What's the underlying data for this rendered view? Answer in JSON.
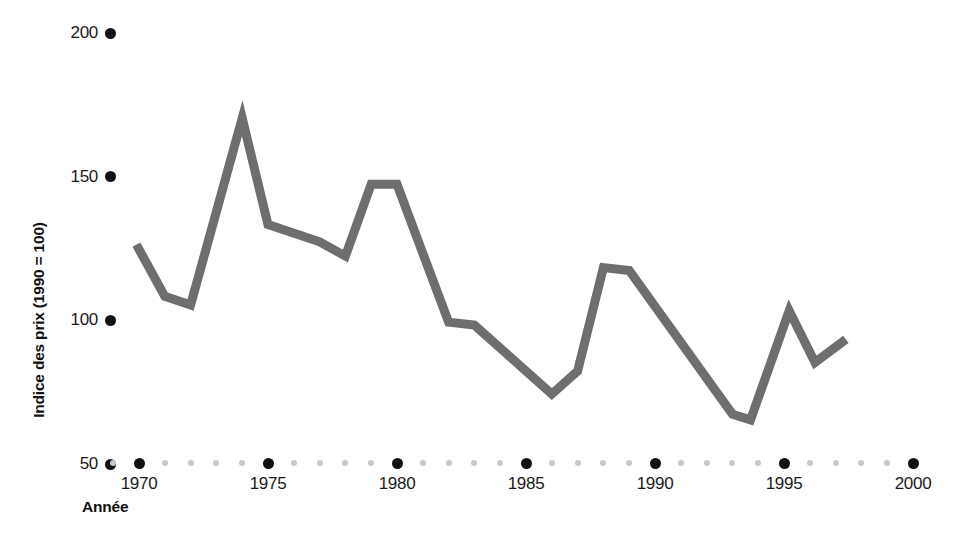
{
  "chart_data": {
    "type": "line",
    "title": "",
    "xlabel": "Année",
    "ylabel": "Indice des prix (1990 = 100)",
    "xlim": [
      1969,
      2000
    ],
    "ylim": [
      50,
      200
    ],
    "yticks": [
      50,
      100,
      150,
      200
    ],
    "xticks": [
      1970,
      1975,
      1980,
      1985,
      1990,
      1995,
      2000
    ],
    "x_minor_step": 1,
    "grid": false,
    "legend": null,
    "line_color": "#6e6e6e",
    "tick_color": "#111111",
    "minor_tick_color": "#c9c9c9",
    "series": [
      {
        "name": "Indice des prix",
        "x": [
          1969.9,
          1971.0,
          1972.0,
          1974.0,
          1975.0,
          1977.0,
          1978.0,
          1979.0,
          1980.0,
          1982.0,
          1983.0,
          1986.0,
          1987.0,
          1988.0,
          1989.0,
          1993.0,
          1993.7,
          1995.2,
          1996.2,
          1997.4
        ],
        "values": [
          126,
          108,
          105,
          170,
          133,
          127,
          122,
          147,
          147,
          99,
          98,
          74,
          82,
          118,
          117,
          67,
          65,
          103,
          85,
          93
        ]
      }
    ]
  },
  "axis": {
    "y_tick_labels": [
      "200",
      "150",
      "100",
      "50"
    ],
    "x_tick_labels": [
      "1970",
      "1975",
      "1980",
      "1985",
      "1990",
      "1995",
      "2000"
    ],
    "y_axis_title": "Indice des prix (1990 = 100)",
    "x_axis_title": "Année"
  }
}
